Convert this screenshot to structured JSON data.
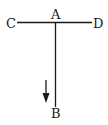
{
  "diagram": {
    "points": [
      {
        "id": "A",
        "label": "A"
      },
      {
        "id": "B",
        "label": "B"
      },
      {
        "id": "C",
        "label": "C"
      },
      {
        "id": "D",
        "label": "D"
      }
    ],
    "segments": [
      {
        "from": "C",
        "to": "D",
        "name": "horizontal-bar"
      },
      {
        "from": "A",
        "to": "B",
        "name": "vertical-bar"
      }
    ],
    "arrow": {
      "direction": "down"
    },
    "colors": {
      "stroke": "#1a1a1a",
      "background": "#ffffff"
    }
  }
}
